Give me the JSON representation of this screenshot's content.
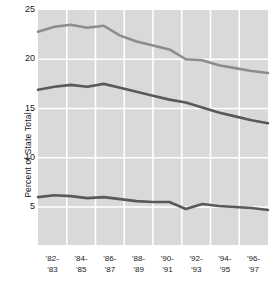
{
  "chart_data": {
    "type": "line",
    "title": "",
    "xlabel": "",
    "ylabel": "Percent of State Total",
    "ylim": [
      5,
      25
    ],
    "yticks": [
      5,
      10,
      15,
      20,
      25
    ],
    "ytick_labels": [
      "5",
      "10",
      "15",
      "20",
      "25"
    ],
    "grid": true,
    "legend": "none",
    "categories": [
      "'82-'83",
      "'83-'84",
      "'84-'85",
      "'85-'86",
      "'86-'87",
      "'87-'88",
      "'88-'89",
      "'89-'90",
      "'90-'91",
      "'91-'92",
      "'92-'93",
      "'93-'94",
      "'94-'95",
      "'95-'96",
      "'96-'97"
    ],
    "xtick_labels": [
      {
        "top": "'82-",
        "bottom": "'83"
      },
      {
        "top": "'84-",
        "bottom": "'85"
      },
      {
        "top": "'86-",
        "bottom": "'87"
      },
      {
        "top": "'88-",
        "bottom": "'89"
      },
      {
        "top": "'90-",
        "bottom": "'91"
      },
      {
        "top": "'92-",
        "bottom": "'93"
      },
      {
        "top": "'94-",
        "bottom": "'95"
      },
      {
        "top": "'96-",
        "bottom": "'97"
      }
    ],
    "series": [
      {
        "name": "upper-line",
        "color": "#8c8c8c",
        "values": [
          22.8,
          23.3,
          23.5,
          23.2,
          23.4,
          22.4,
          21.8,
          21.4,
          21.0,
          20.0,
          19.9,
          19.4,
          19.1,
          18.8,
          18.6
        ]
      },
      {
        "name": "middle-line",
        "color": "#595959",
        "values": [
          16.9,
          17.2,
          17.4,
          17.2,
          17.5,
          17.1,
          16.7,
          16.3,
          15.9,
          15.6,
          15.1,
          14.6,
          14.2,
          13.8,
          13.5
        ]
      },
      {
        "name": "lower-line",
        "color": "#595959",
        "values": [
          6.0,
          6.2,
          6.1,
          5.9,
          6.0,
          5.8,
          5.6,
          5.5,
          5.5,
          4.8,
          5.3,
          5.1,
          5.0,
          4.9,
          4.7
        ]
      }
    ],
    "plot_background": "#d9d9d9",
    "gridline_color": "#ffffff"
  }
}
